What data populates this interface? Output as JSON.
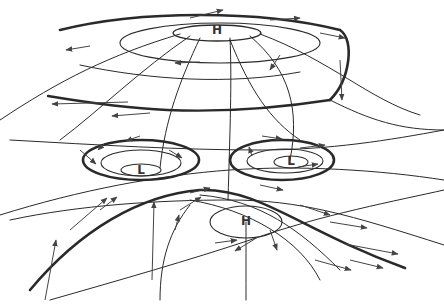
{
  "diagram": {
    "type": "pressure-systems-sketch",
    "colors": {
      "line": "#2a2a2a",
      "arrow": "#444444",
      "background": "#ffffff"
    },
    "centers": [
      {
        "id": "high-top",
        "label": "H",
        "x": 217,
        "y": 30
      },
      {
        "id": "low-left",
        "label": "L",
        "x": 141,
        "y": 170
      },
      {
        "id": "low-right",
        "label": "L",
        "x": 291,
        "y": 161
      },
      {
        "id": "high-bottom",
        "label": "H",
        "x": 246,
        "y": 221
      }
    ]
  }
}
